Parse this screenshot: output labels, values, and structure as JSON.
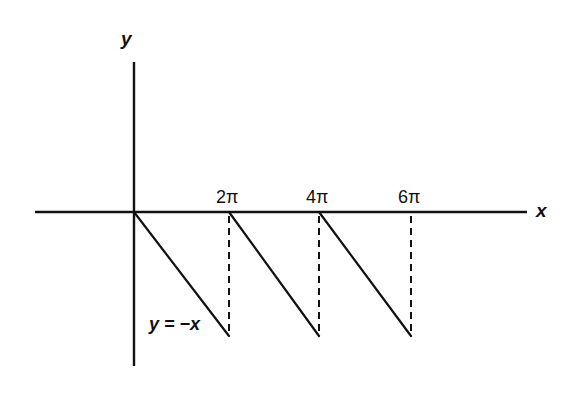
{
  "diagram": {
    "type": "function-graph",
    "axes": {
      "x_label": "x",
      "y_label": "y",
      "origin_px": [
        134,
        212
      ],
      "x_axis_px": {
        "x1": 35,
        "x2": 527,
        "y": 212
      },
      "y_axis_px": {
        "x": 134,
        "y1": 62,
        "y2": 366
      }
    },
    "ticks": [
      {
        "label": "2π",
        "px_x": 229
      },
      {
        "label": "4π",
        "px_x": 319
      },
      {
        "label": "6π",
        "px_x": 411
      }
    ],
    "segments": [
      {
        "from": [
          0,
          0
        ],
        "to": [
          "2π",
          "-2π"
        ],
        "px": [
          134,
          212,
          229,
          336
        ]
      },
      {
        "from": [
          "2π",
          0
        ],
        "to": [
          "4π",
          "-2π"
        ],
        "px": [
          229,
          212,
          319,
          336
        ]
      },
      {
        "from": [
          "4π",
          0
        ],
        "to": [
          "6π",
          "-2π"
        ],
        "px": [
          319,
          212,
          411,
          336
        ]
      }
    ],
    "dashed_verticals": [
      {
        "at": "2π",
        "px": [
          229,
          214,
          229,
          336
        ]
      },
      {
        "at": "4π",
        "px": [
          319,
          214,
          319,
          336
        ]
      },
      {
        "at": "6π",
        "px": [
          411,
          214,
          411,
          336
        ]
      }
    ],
    "curve_label": "y = −x",
    "line_color": "#111111",
    "background": "#ffffff"
  }
}
